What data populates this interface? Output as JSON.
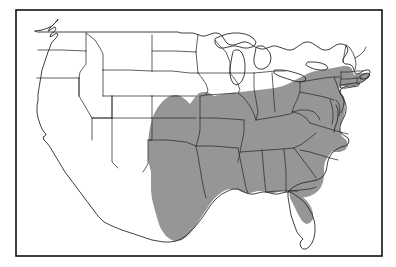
{
  "figure": {
    "type": "distribution-range-map",
    "region": "United States (contiguous)",
    "title": "",
    "caption": "",
    "frame": {
      "border_color": "#111111",
      "background_color": "#ffffff",
      "x": 16,
      "y": 10,
      "width": 366,
      "height": 246
    }
  },
  "map": {
    "projection_note": "conic, contiguous US",
    "outline_color": "#2b2b2b",
    "shading": {
      "label": "shaded range",
      "fill_color": "#969696",
      "pattern": "halftone gray",
      "opacity": 1
    },
    "unshaded": {
      "label": "outside range",
      "fill_color": "#ffffff"
    }
  },
  "shaded_area": {
    "description": "Continuous shaded band covering the southern, south-central, mid-Atlantic, Ohio Valley and southern New England portions of the United States.",
    "states_shaded": [
      "Texas",
      "Oklahoma",
      "Arkansas",
      "Louisiana",
      "Mississippi",
      "Alabama",
      "Georgia",
      "South Carolina",
      "North Carolina",
      "Tennessee",
      "Kentucky",
      "Virginia",
      "West Virginia",
      "Maryland",
      "Delaware",
      "New Jersey",
      "Pennsylvania",
      "Ohio",
      "Indiana",
      "Illinois",
      "Missouri",
      "Connecticut",
      "Rhode Island",
      "Massachusetts"
    ],
    "states_partially_shaded": [
      "Florida (panhandle and northern peninsula only)",
      "Kansas (southeastern corner)",
      "Missouri (southern and eastern portions)",
      "Massachusetts (southern and eastern portions)",
      "New York (southeastern corner only)"
    ],
    "states_unshaded": [
      "Washington",
      "Oregon",
      "California",
      "Nevada",
      "Idaho",
      "Montana",
      "Wyoming",
      "Utah",
      "Arizona",
      "Colorado",
      "New Mexico",
      "North Dakota",
      "South Dakota",
      "Nebraska",
      "Minnesota",
      "Iowa",
      "Wisconsin",
      "Michigan",
      "New York",
      "Vermont",
      "New Hampshire",
      "Maine",
      "Florida (southern peninsula)"
    ]
  },
  "annotations": {
    "scale_bar": "",
    "north_arrow": "",
    "legend_entries": []
  }
}
